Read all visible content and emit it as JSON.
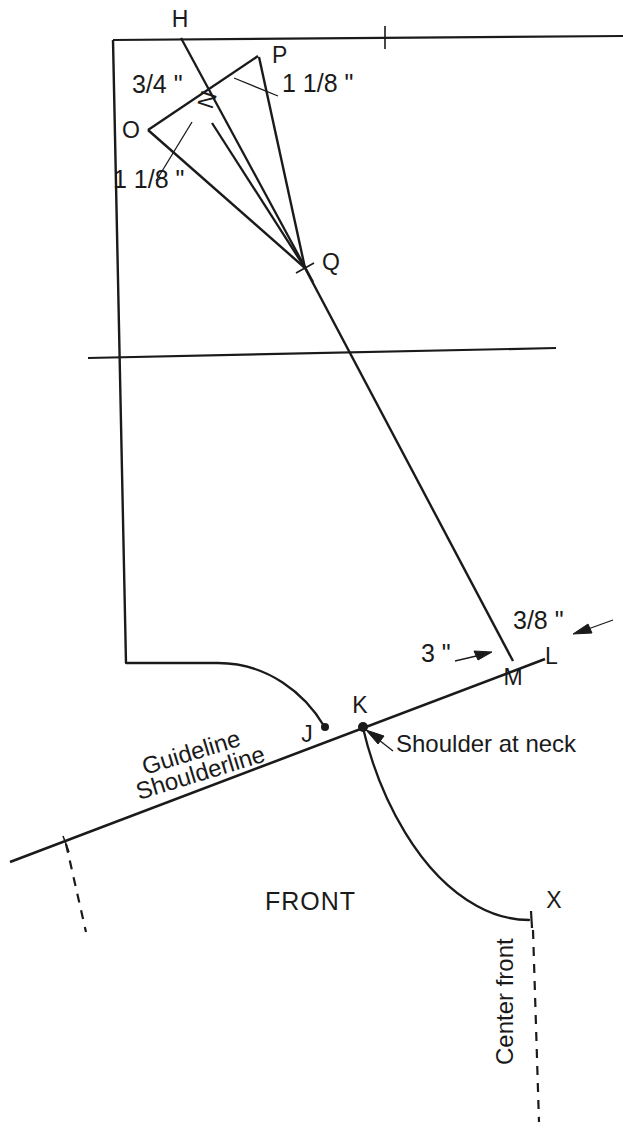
{
  "diagram": {
    "background_color": "#ffffff",
    "ink_color": "#1a1a1a",
    "width": 623,
    "height": 1130,
    "points": [
      {
        "id": "H",
        "label": "H",
        "x": 180,
        "y": 27
      },
      {
        "id": "P",
        "label": "P",
        "x": 272,
        "y": 63
      },
      {
        "id": "N",
        "label": "N",
        "x": 212,
        "y": 110
      },
      {
        "id": "O",
        "label": "O",
        "x": 131,
        "y": 138
      },
      {
        "id": "Q",
        "label": "Q",
        "x": 322,
        "y": 270
      },
      {
        "id": "L",
        "label": "L",
        "x": 545,
        "y": 664
      },
      {
        "id": "M",
        "label": "M",
        "x": 513,
        "y": 685
      },
      {
        "id": "K",
        "label": "K",
        "x": 360,
        "y": 713
      },
      {
        "id": "J",
        "label": "J",
        "x": 307,
        "y": 742
      },
      {
        "id": "X",
        "label": "X",
        "x": 554,
        "y": 908
      }
    ],
    "dimensions": [
      {
        "id": "dim-three-quarter",
        "label": "3/4 \"",
        "x": 132,
        "y": 93
      },
      {
        "id": "dim-one-and-eighth-upper",
        "label": "1 1/8 \"",
        "x": 282,
        "y": 92
      },
      {
        "id": "dim-one-and-eighth-lower",
        "label": "1 1/8 \"",
        "x": 113,
        "y": 188
      },
      {
        "id": "dim-three-inch",
        "label": "3 \"",
        "x": 421,
        "y": 662
      },
      {
        "id": "dim-three-eighth",
        "label": "3/8 \"",
        "x": 513,
        "y": 629
      }
    ],
    "notes": [
      {
        "id": "note-shoulder-at-neck",
        "label": "Shoulder at neck",
        "x": 396,
        "y": 752
      },
      {
        "id": "note-front",
        "label": "FRONT",
        "x": 265,
        "y": 910
      },
      {
        "id": "note-guideline",
        "label": "Guideline",
        "x": 145,
        "y": 775,
        "rotation": -17
      },
      {
        "id": "note-shoulderline",
        "label": "Shoulderline",
        "x": 139,
        "y": 800,
        "rotation": -17
      },
      {
        "id": "note-center-front",
        "label": "Center front",
        "x": 513,
        "y": 1065,
        "rotation": -90
      }
    ],
    "icons": {
      "arrow_right": "arrow-right-icon",
      "arrow_left": "arrow-left-icon",
      "arrow_pointer": "arrow-pointer-icon"
    }
  }
}
